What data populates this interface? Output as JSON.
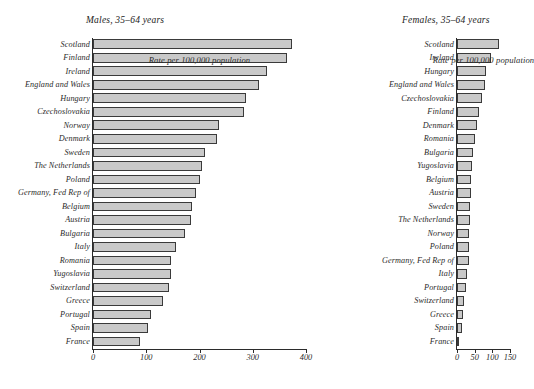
{
  "chart_data": [
    {
      "type": "bar",
      "orientation": "horizontal",
      "title": "Males, 35–64 years",
      "xlabel": "Rate per 100,000 population",
      "ylabel": "",
      "xlim": [
        0,
        400
      ],
      "xticks": [
        0,
        100,
        200,
        300,
        400
      ],
      "grid": false,
      "legend": null,
      "categories": [
        "Scotland",
        "Finland",
        "Ireland",
        "England and Wales",
        "Hungary",
        "Czechoslovakia",
        "Norway",
        "Denmark",
        "Sweden",
        "The Netherlands",
        "Poland",
        "Germany, Fed Rep of",
        "Belgium",
        "Austria",
        "Bulgaria",
        "Italy",
        "Romania",
        "Yugoslavia",
        "Switzerland",
        "Greece",
        "Portugal",
        "Spain",
        "France"
      ],
      "values": [
        373,
        365,
        327,
        312,
        288,
        283,
        237,
        233,
        211,
        204,
        201,
        193,
        186,
        184,
        173,
        155,
        146,
        146,
        142,
        131,
        109,
        103,
        89
      ]
    },
    {
      "type": "bar",
      "orientation": "horizontal",
      "title": "Females, 35–64 years",
      "xlabel": "Rate per 100,000 population",
      "ylabel": "",
      "xlim": [
        0,
        150
      ],
      "xticks": [
        0,
        50,
        100,
        150
      ],
      "grid": false,
      "legend": null,
      "categories": [
        "Scotland",
        "Ireland",
        "Hungary",
        "England and Wales",
        "Czechoslovakia",
        "Finland",
        "Denmark",
        "Romania",
        "Bulgaria",
        "Yugoslavia",
        "Belgium",
        "Austria",
        "Sweden",
        "The Netherlands",
        "Norway",
        "Poland",
        "Germany, Fed Rep of",
        "Italy",
        "Portugal",
        "Switzerland",
        "Greece",
        "Spain",
        "France"
      ],
      "values": [
        118,
        95,
        83,
        80,
        72,
        62,
        56,
        51,
        44,
        42,
        40,
        39,
        38,
        37,
        35,
        34,
        33,
        27,
        26,
        19,
        17,
        14,
        7
      ]
    }
  ],
  "style": {
    "bar_fill": "#c9c9c9",
    "bar_stroke": "#3a3a3a",
    "axis_color": "#2b2b2b",
    "background": "#ffffff"
  }
}
